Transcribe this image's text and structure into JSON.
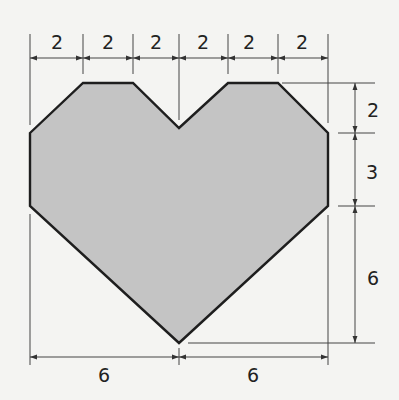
{
  "diagram": {
    "colors": {
      "fill": "#c4c4c4",
      "stroke": "#1e1e1e",
      "dim_line": "#444444",
      "background": "#f4f4f2"
    },
    "top_dimensions": [
      "2",
      "2",
      "2",
      "2",
      "2",
      "2"
    ],
    "right_dimensions": [
      "2",
      "3",
      "6"
    ],
    "bottom_dimensions": [
      "6",
      "6"
    ],
    "shape": {
      "name": "heart",
      "vertices_units": [
        [
          0,
          5
        ],
        [
          2,
          3
        ],
        [
          4,
          3
        ],
        [
          6,
          5
        ],
        [
          8,
          3
        ],
        [
          10,
          3
        ],
        [
          12,
          5
        ],
        [
          12,
          8
        ],
        [
          6,
          14
        ],
        [
          0,
          8
        ]
      ]
    }
  }
}
